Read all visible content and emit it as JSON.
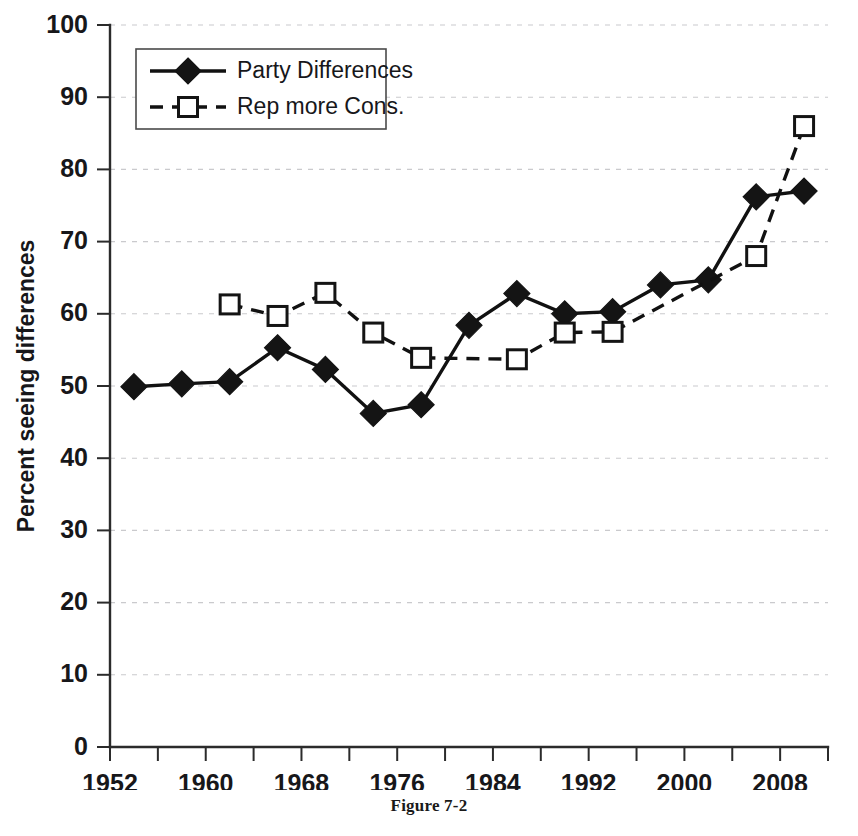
{
  "figure": {
    "caption": "Figure 7-2"
  },
  "chart_data": {
    "type": "line",
    "title": "",
    "xlabel": "",
    "ylabel": "Percent seeing differences",
    "xlim": [
      1952,
      2012
    ],
    "ylim": [
      0,
      100
    ],
    "grid": true,
    "legend_position": "top-left-inside",
    "y_ticks": [
      0,
      10,
      20,
      30,
      40,
      50,
      60,
      70,
      80,
      90,
      100
    ],
    "y_tick_labels": [
      "0",
      "10",
      "20",
      "30",
      "40",
      "50",
      "60",
      "70",
      "80",
      "90",
      "100"
    ],
    "x_ticks_major": [
      1952,
      1960,
      1968,
      1976,
      1984,
      1992,
      2000,
      2008
    ],
    "x_tick_labels": [
      "1952",
      "1960",
      "1968",
      "1976",
      "1984",
      "1992",
      "2000",
      "2008"
    ],
    "x_ticks_minor": [
      1956,
      1964,
      1972,
      1980,
      1988,
      1996,
      2004,
      2012
    ],
    "series": [
      {
        "name": "Party Differences",
        "style": "solid",
        "marker": "filled-diamond",
        "color": "#141414",
        "x": [
          1954,
          1958,
          1962,
          1966,
          1970,
          1974,
          1978,
          1982,
          1986,
          1990,
          1994,
          1998,
          2002,
          2006,
          2010
        ],
        "values": [
          49.9,
          50.3,
          50.6,
          55.3,
          52.3,
          46.2,
          47.4,
          58.4,
          62.8,
          60.0,
          60.3,
          64.0,
          64.7,
          76.2,
          77.0
        ]
      },
      {
        "name": "Rep more Cons.",
        "style": "dashed",
        "marker": "open-square",
        "color": "#141414",
        "x": [
          1962,
          1966,
          1970,
          1974,
          1978,
          1986,
          1990,
          1994,
          2006,
          2010
        ],
        "values": [
          61.3,
          59.7,
          62.9,
          57.4,
          53.9,
          53.7,
          57.4,
          57.5,
          68.0,
          86.0
        ]
      }
    ]
  },
  "legend": {
    "entries": [
      {
        "label": "Party Differences",
        "marker": "filled-diamond",
        "style": "solid"
      },
      {
        "label": "Rep more Cons.",
        "marker": "open-square",
        "style": "dashed"
      }
    ]
  }
}
